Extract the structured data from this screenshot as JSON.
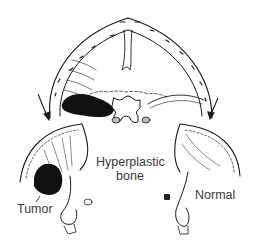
{
  "figure": {
    "type": "anatomical-illustration",
    "labels": {
      "hyperplastic_line1": "Hyperplastic",
      "hyperplastic_line2": "bone",
      "tumor": "Tumor",
      "normal": "Normal"
    },
    "colors": {
      "ink": "#1a1a1a",
      "tumor_fill": "#111111",
      "background": "#ffffff"
    }
  }
}
